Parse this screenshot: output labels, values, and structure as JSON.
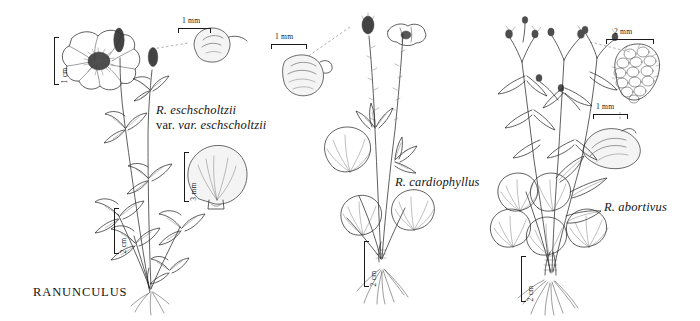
{
  "plate": {
    "genus_title": "RANUNCULUS",
    "background_color": "#ffffff",
    "ink_color": "#2b2b2b",
    "width": 700,
    "height": 321,
    "medium": "pen-and-ink line drawing"
  },
  "panels": [
    {
      "id": "left",
      "taxon_line1": "R. eschscholtzii",
      "taxon_line2": "var. eschscholtzii",
      "figures": [
        {
          "name": "flower-face-view",
          "scale": "1 cm",
          "orientation": "vertical"
        },
        {
          "name": "achene-detail",
          "scale": "1 mm",
          "orientation": "horizontal"
        },
        {
          "name": "petal-detail",
          "scale": "3 mm",
          "orientation": "vertical"
        },
        {
          "name": "habit-whole-plant",
          "scale": "2 cm",
          "orientation": "vertical"
        }
      ],
      "scales": [
        {
          "label": "1 cm",
          "orientation": "vertical"
        },
        {
          "label": "1 mm",
          "orientation": "horizontal"
        },
        {
          "label": "3 mm",
          "orientation": "vertical"
        },
        {
          "label": "2 cm",
          "orientation": "vertical"
        }
      ]
    },
    {
      "id": "middle",
      "taxon_line1": "R. cardiophyllus",
      "taxon_line2": "",
      "figures": [
        {
          "name": "achene-detail",
          "scale": "1 mm",
          "orientation": "horizontal"
        },
        {
          "name": "habit-whole-plant",
          "scale": "2 cm",
          "orientation": "vertical"
        }
      ],
      "scales": [
        {
          "label": "1 mm",
          "orientation": "horizontal"
        },
        {
          "label": "2 cm",
          "orientation": "vertical"
        }
      ]
    },
    {
      "id": "right",
      "taxon_line1": "R. abortivus",
      "taxon_line2": "",
      "figures": [
        {
          "name": "aggregate-fruit-head-detail",
          "scale": "2 mm",
          "orientation": "horizontal"
        },
        {
          "name": "achene-detail",
          "scale": "1 mm",
          "orientation": "horizontal"
        },
        {
          "name": "habit-whole-plant",
          "scale": "2 cm",
          "orientation": "vertical"
        }
      ],
      "scales": [
        {
          "label": "2 mm",
          "orientation": "horizontal"
        },
        {
          "label": "1 mm",
          "orientation": "horizontal"
        },
        {
          "label": "2 cm",
          "orientation": "vertical"
        }
      ]
    }
  ]
}
